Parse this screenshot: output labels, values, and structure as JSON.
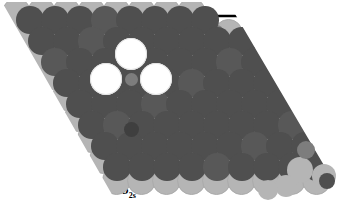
{
  "figure": {
    "kind": "atomic-surface-model",
    "width": 342,
    "height": 209,
    "background": "#ffffff"
  },
  "palette": {
    "substrate_light": "#b5b5b5",
    "substrate_light_edge": "#aaaaaa",
    "mid_gray": "#7d7d7d",
    "dark_gray": "#4f4f4f",
    "dark_gray_alt": "#585858",
    "white_disc": "#ffffff",
    "ink": "#000000"
  },
  "labels": {
    "site1": "1",
    "site2": "2",
    "delta1": "δ",
    "delta1_sub": "1s",
    "delta2": "δ",
    "delta2_sub": "2s"
  },
  "vectors": {
    "lattice_a_name": "lattice-vector-a",
    "lattice_b_name": "lattice-vector-b",
    "displacement_1_name": "displacement-delta-1s",
    "displacement_2_name": "displacement-delta-2s"
  },
  "lattice": {
    "row_dx": 25.2,
    "row_dy": 21.4,
    "shear": 12.6,
    "origin_x": 18,
    "origin_y": 14,
    "cols": 13,
    "rows": 9,
    "big_r": 14.5,
    "small_r": 6.0
  },
  "atoms": {
    "substrate": [
      [
        16,
        12
      ],
      [
        41,
        12
      ],
      [
        66,
        12
      ],
      [
        91,
        12
      ],
      [
        116,
        12
      ],
      [
        141,
        12
      ],
      [
        166,
        12
      ],
      [
        191,
        12
      ],
      [
        28,
        33
      ],
      [
        53,
        33
      ],
      [
        78,
        33
      ],
      [
        103,
        33
      ],
      [
        128,
        33
      ],
      [
        153,
        33
      ],
      [
        178,
        33
      ],
      [
        203,
        33
      ],
      [
        228,
        33
      ],
      [
        41,
        54
      ],
      [
        66,
        54
      ],
      [
        91,
        54
      ],
      [
        116,
        54
      ],
      [
        141,
        54
      ],
      [
        166,
        54
      ],
      [
        191,
        54
      ],
      [
        216,
        54
      ],
      [
        241,
        54
      ],
      [
        53,
        75
      ],
      [
        78,
        75
      ],
      [
        103,
        75
      ],
      [
        128,
        75
      ],
      [
        153,
        75
      ],
      [
        178,
        75
      ],
      [
        203,
        75
      ],
      [
        228,
        75
      ],
      [
        253,
        75
      ],
      [
        278,
        75
      ],
      [
        66,
        96
      ],
      [
        91,
        96
      ],
      [
        116,
        96
      ],
      [
        141,
        96
      ],
      [
        166,
        96
      ],
      [
        191,
        96
      ],
      [
        216,
        96
      ],
      [
        241,
        96
      ],
      [
        266,
        96
      ],
      [
        291,
        96
      ],
      [
        78,
        117
      ],
      [
        103,
        117
      ],
      [
        128,
        117
      ],
      [
        153,
        117
      ],
      [
        178,
        117
      ],
      [
        203,
        117
      ],
      [
        228,
        117
      ],
      [
        253,
        117
      ],
      [
        278,
        117
      ],
      [
        303,
        117
      ],
      [
        91,
        138
      ],
      [
        116,
        138
      ],
      [
        141,
        138
      ],
      [
        166,
        138
      ],
      [
        191,
        138
      ],
      [
        216,
        138
      ],
      [
        241,
        138
      ],
      [
        266,
        138
      ],
      [
        291,
        138
      ],
      [
        316,
        138
      ],
      [
        103,
        159
      ],
      [
        128,
        159
      ],
      [
        153,
        159
      ],
      [
        178,
        159
      ],
      [
        203,
        159
      ],
      [
        228,
        159
      ],
      [
        253,
        159
      ],
      [
        278,
        159
      ],
      [
        303,
        159
      ],
      [
        328,
        159
      ],
      [
        116,
        180
      ],
      [
        141,
        180
      ],
      [
        166,
        180
      ],
      [
        191,
        180
      ],
      [
        216,
        180
      ],
      [
        241,
        180
      ],
      [
        266,
        180
      ],
      [
        291,
        180
      ],
      [
        316,
        180
      ]
    ],
    "top": [
      [
        30,
        20
      ],
      [
        55,
        20
      ],
      [
        80,
        20
      ],
      [
        105,
        20
      ],
      [
        130,
        20
      ],
      [
        155,
        20
      ],
      [
        180,
        20
      ],
      [
        205,
        20
      ],
      [
        42,
        41
      ],
      [
        67,
        41
      ],
      [
        92,
        41
      ],
      [
        117,
        41
      ],
      [
        142,
        41
      ],
      [
        167,
        41
      ],
      [
        192,
        41
      ],
      [
        217,
        41
      ],
      [
        242,
        41
      ],
      [
        55,
        62
      ],
      [
        80,
        62
      ],
      [
        105,
        62
      ],
      [
        130,
        62
      ],
      [
        155,
        62
      ],
      [
        180,
        62
      ],
      [
        205,
        62
      ],
      [
        230,
        62
      ],
      [
        255,
        62
      ],
      [
        67,
        83
      ],
      [
        92,
        83
      ],
      [
        117,
        83
      ],
      [
        142,
        83
      ],
      [
        167,
        83
      ],
      [
        192,
        83
      ],
      [
        217,
        83
      ],
      [
        242,
        83
      ],
      [
        267,
        83
      ],
      [
        80,
        104
      ],
      [
        105,
        104
      ],
      [
        130,
        104
      ],
      [
        155,
        104
      ],
      [
        180,
        104
      ],
      [
        205,
        104
      ],
      [
        230,
        104
      ],
      [
        255,
        104
      ],
      [
        280,
        104
      ],
      [
        92,
        125
      ],
      [
        117,
        125
      ],
      [
        142,
        125
      ],
      [
        167,
        125
      ],
      [
        192,
        125
      ],
      [
        217,
        125
      ],
      [
        242,
        125
      ],
      [
        267,
        125
      ],
      [
        292,
        125
      ],
      [
        105,
        146
      ],
      [
        130,
        146
      ],
      [
        155,
        146
      ],
      [
        180,
        146
      ],
      [
        205,
        146
      ],
      [
        230,
        146
      ],
      [
        255,
        146
      ],
      [
        280,
        146
      ],
      [
        305,
        146
      ],
      [
        117,
        167
      ],
      [
        142,
        167
      ],
      [
        167,
        167
      ],
      [
        192,
        167
      ],
      [
        217,
        167
      ],
      [
        242,
        167
      ],
      [
        267,
        167
      ],
      [
        292,
        167
      ],
      [
        317,
        167
      ]
    ],
    "interstitial": [
      [
        42,
        31
      ],
      [
        67,
        31
      ],
      [
        92,
        31
      ],
      [
        117,
        31
      ],
      [
        142,
        31
      ],
      [
        167,
        31
      ],
      [
        192,
        31
      ],
      [
        217,
        31
      ],
      [
        55,
        52
      ],
      [
        80,
        52
      ],
      [
        105,
        52
      ],
      [
        130,
        52
      ],
      [
        155,
        52
      ],
      [
        180,
        52
      ],
      [
        205,
        52
      ],
      [
        230,
        52
      ],
      [
        67,
        73
      ],
      [
        92,
        73
      ],
      [
        117,
        73
      ],
      [
        142,
        73
      ],
      [
        167,
        73
      ],
      [
        192,
        73
      ],
      [
        217,
        73
      ],
      [
        242,
        73
      ],
      [
        267,
        73
      ],
      [
        80,
        94
      ],
      [
        105,
        94
      ],
      [
        130,
        94
      ],
      [
        155,
        94
      ],
      [
        180,
        94
      ],
      [
        205,
        94
      ],
      [
        230,
        94
      ],
      [
        255,
        94
      ],
      [
        280,
        94
      ],
      [
        92,
        115
      ],
      [
        117,
        115
      ],
      [
        142,
        115
      ],
      [
        167,
        115
      ],
      [
        192,
        115
      ],
      [
        217,
        115
      ],
      [
        242,
        115
      ],
      [
        267,
        115
      ],
      [
        292,
        115
      ],
      [
        105,
        136
      ],
      [
        130,
        136
      ],
      [
        155,
        136
      ],
      [
        180,
        136
      ],
      [
        205,
        136
      ],
      [
        230,
        136
      ],
      [
        255,
        136
      ],
      [
        280,
        136
      ],
      [
        305,
        136
      ],
      [
        117,
        157
      ],
      [
        142,
        157
      ],
      [
        167,
        157
      ],
      [
        192,
        157
      ],
      [
        217,
        157
      ],
      [
        242,
        157
      ],
      [
        267,
        157
      ],
      [
        292,
        157
      ],
      [
        317,
        157
      ]
    ],
    "white_discs": [
      [
        131,
        54,
        16
      ],
      [
        106,
        79,
        16
      ],
      [
        156,
        79,
        16
      ]
    ],
    "center_small": [
      131,
      79
    ]
  }
}
